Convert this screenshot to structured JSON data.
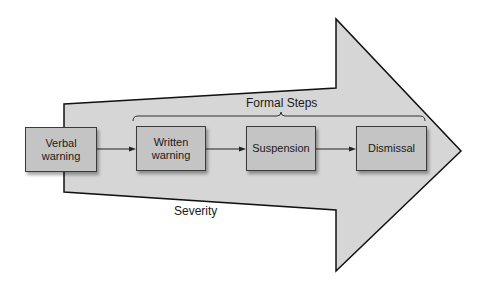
{
  "diagram": {
    "formal_label": "Formal Steps",
    "severity_label": "Severity",
    "steps": [
      {
        "label": "Verbal\nwarning",
        "formal": false
      },
      {
        "label": "Written\nwarning",
        "formal": true
      },
      {
        "label": "Suspension",
        "formal": true
      },
      {
        "label": "Dismissal",
        "formal": true
      }
    ],
    "colors": {
      "arrow_fill": "#d6d6d6",
      "arrow_stroke": "#111111",
      "box_fill": "#c4c4c4",
      "box_stroke": "#3a3a3a"
    }
  }
}
